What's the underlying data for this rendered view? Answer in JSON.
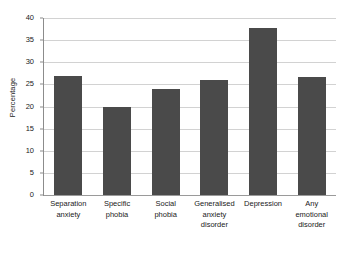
{
  "chart_data": {
    "type": "bar",
    "title": "",
    "xlabel": "",
    "ylabel": "Percentage",
    "ylim": [
      0,
      40
    ],
    "ytick_step": 5,
    "yticks": [
      "0",
      "5",
      "10",
      "15",
      "20",
      "25",
      "30",
      "35",
      "40"
    ],
    "grid": true,
    "legend": "none",
    "bar_color": "#4a4a4a",
    "gridline_color": "#d2d2d2",
    "axis_color": "#8c8c8c",
    "categories": [
      "Separation anxiety",
      "Specific phobia",
      "Social phobia",
      "Generalised anxiety disorder",
      "Depression",
      "Any emotional disorder"
    ],
    "category_label_lines": [
      [
        "Separation",
        "anxiety"
      ],
      [
        "Specific",
        "phobia"
      ],
      [
        "Social",
        "phobia"
      ],
      [
        "Generalised",
        "anxiety",
        "disorder"
      ],
      [
        "Depression"
      ],
      [
        "Any",
        "emotional",
        "disorder"
      ]
    ],
    "values": [
      26.9,
      19.9,
      24.0,
      25.9,
      37.8,
      26.7
    ]
  }
}
